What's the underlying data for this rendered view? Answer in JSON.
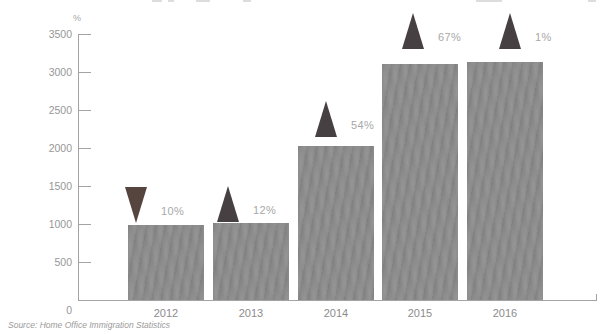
{
  "chart_data": {
    "type": "bar",
    "title": "",
    "unit_label": "%",
    "categories": [
      "2012",
      "2013",
      "2014",
      "2015",
      "2016"
    ],
    "values": [
      990,
      1010,
      2020,
      3100,
      3130
    ],
    "ylim": [
      0,
      3500
    ],
    "ytick_step": 500,
    "yticks": [
      3500,
      3000,
      2500,
      2000,
      1500,
      1000,
      500
    ],
    "zero_label": "0",
    "grid": false,
    "legend": "none",
    "bar_color": "#8f8f8f",
    "marker_up_color": "#474043",
    "marker_down_color": "#56453f",
    "percent_label_color": "#a8a8a8",
    "markers": [
      {
        "direction": "down",
        "label": "10%"
      },
      {
        "direction": "up",
        "label": "12%"
      },
      {
        "direction": "up",
        "label": "54%"
      },
      {
        "direction": "up",
        "label": "67%"
      },
      {
        "direction": "up",
        "label": "1%"
      }
    ],
    "layout": {
      "baseline_y": 300,
      "px_per_unit": 0.076,
      "bar_width": 76,
      "bar_centers": [
        166,
        251,
        336,
        420,
        505
      ],
      "marker_dx": [
        -30,
        -23,
        -10,
        -7,
        5
      ],
      "marker_gap": [
        2,
        1,
        9,
        15,
        13
      ],
      "marker_w": 22,
      "marker_h": 36,
      "axis_x": 78,
      "axis_right": 597
    }
  },
  "source_note": "Source: Home Office Immigration Statistics"
}
